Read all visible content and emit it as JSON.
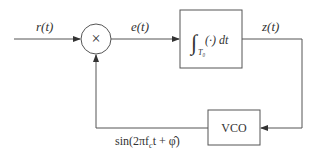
{
  "diagram": {
    "title": "",
    "type": "block-diagram",
    "signals": {
      "input": "r(t)",
      "error": "e(t)",
      "integrator_out": "z(t)",
      "feedback_prefix": "sin(2πf",
      "feedback_sub": "c",
      "feedback_suffix": "t + φ̂)"
    },
    "blocks": {
      "multiplier": {
        "symbol": "×"
      },
      "integrator": {
        "integral": "∫",
        "sub": "T₀",
        "body": "(·) dt"
      },
      "vco": {
        "label": "VCO"
      }
    },
    "colors": {
      "stroke": "#444444",
      "text": "#333333",
      "background": "#ffffff"
    }
  }
}
